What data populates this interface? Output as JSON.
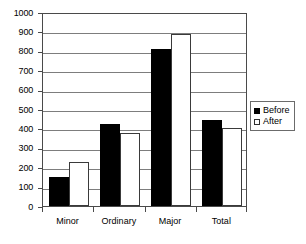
{
  "chart_data": {
    "type": "bar",
    "title": "",
    "subtitle": "",
    "xlabel": "",
    "ylabel": "",
    "categories": [
      "Minor",
      "Ordinary",
      "Major",
      "Total"
    ],
    "series": [
      {
        "name": "Before",
        "values": [
          150,
          425,
          810,
          445
        ],
        "color": "#000000"
      },
      {
        "name": "After",
        "values": [
          225,
          375,
          885,
          400
        ],
        "color": "#ffffff"
      }
    ],
    "ylim": [
      0,
      1000
    ],
    "ytick_step": 100,
    "yticks": [
      0,
      100,
      200,
      300,
      400,
      500,
      600,
      700,
      800,
      900,
      1000
    ],
    "ytick_labels": [
      "0",
      "100",
      "200",
      "300",
      "400",
      "500",
      "600",
      "700",
      "800",
      "900",
      "1000"
    ],
    "grid": true,
    "grid_axis": "y",
    "legend": {
      "position": "right",
      "entries": [
        {
          "label": "Before",
          "swatch": "filled-black-square"
        },
        {
          "label": "After",
          "swatch": "empty-white-square"
        }
      ]
    },
    "frame": {
      "border_color": "#4a4a4a",
      "gridline_color": "#7d7d7d",
      "background": "#ffffff"
    }
  }
}
